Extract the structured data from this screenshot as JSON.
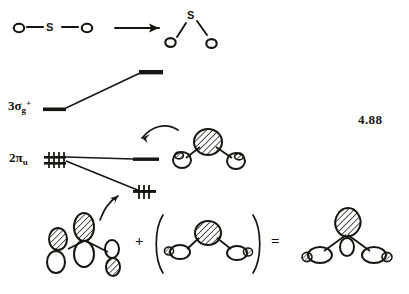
{
  "figure": {
    "number": "4.88"
  },
  "top_row": {
    "linear_molecule": {
      "name": "linear-SO2",
      "atoms": [
        {
          "label": "O",
          "x": 18,
          "y": 28
        },
        {
          "label": "S",
          "x": 52,
          "y": 28
        },
        {
          "label": "O",
          "x": 86,
          "y": 28
        }
      ],
      "bonds": [
        {
          "from": "O",
          "to": "S"
        },
        {
          "from": "S",
          "to": "O"
        }
      ]
    },
    "reaction_arrow": {
      "name": "reaction-arrow",
      "direction": "right"
    },
    "bent_molecule": {
      "name": "bent-SO2",
      "atoms": [
        {
          "label": "S",
          "x": 190,
          "y": 16
        },
        {
          "label": "O",
          "x": 169,
          "y": 41
        },
        {
          "label": "O",
          "x": 210,
          "y": 43
        }
      ],
      "bonds": [
        {
          "from": "S",
          "to": "O-left"
        },
        {
          "from": "S",
          "to": "O-right"
        }
      ]
    }
  },
  "correlation_diagram": {
    "levels": [
      {
        "name": "sigma-g-level-left",
        "label_html": "3σ",
        "label_sub": "g",
        "label_sup": "+",
        "label_plain": "3σg+",
        "electrons": 0,
        "side": "left"
      },
      {
        "name": "sigma-g-level-right",
        "label_plain": "",
        "electrons": 0,
        "side": "right"
      },
      {
        "name": "pi-u-level-left",
        "label_html": "2π",
        "label_sub": "u",
        "label_sup": "",
        "label_plain": "2πu",
        "electrons": 4,
        "degenerate": true,
        "side": "left"
      },
      {
        "name": "pi-u-level-right-upper",
        "label_plain": "",
        "electrons": 0,
        "side": "right"
      },
      {
        "name": "pi-u-level-right-lower",
        "label_plain": "",
        "electrons": 2,
        "side": "right"
      }
    ],
    "correlation_lines": [
      {
        "name": "line-sigma-g-up",
        "from": "3σg+",
        "to": "upper-right-level"
      },
      {
        "name": "line-pi-u-flat",
        "from": "2πu",
        "to": "middle-right-level"
      },
      {
        "name": "line-pi-u-down",
        "from": "2πu",
        "to": "lower-right-level"
      }
    ],
    "pointer_arrows": [
      {
        "name": "curved-arrow-upper",
        "points_to": "middle-right-level",
        "from": "bent-mo-sketch"
      },
      {
        "name": "curved-arrow-lower",
        "points_to": "lower-right-level",
        "from": "bent-pi-orbital-sketch"
      }
    ]
  },
  "orbital_sketches": {
    "mo_top": {
      "name": "bent-mo-sketch",
      "description": "bent SO2 molecular orbital, large hatched central lobe with two small shaded end lobes"
    },
    "term_left": {
      "name": "bent-pi-orbital-sketch",
      "description": "bent arrangement of p orbitals, hatched upper lobes"
    },
    "term_right": {
      "name": "bracketed-orbital-sketch",
      "description": "hatched central s-type lobe with two end p lobes, enclosed in parentheses"
    },
    "result": {
      "name": "resultant-orbital-sketch",
      "description": "resultant bent molecular orbital with hatched top lobe"
    }
  },
  "operators": {
    "plus": "+",
    "equals": "="
  },
  "colors": {
    "ink": "#17150f",
    "paper": "#ffffff",
    "hatch": "#1a1a1a"
  }
}
